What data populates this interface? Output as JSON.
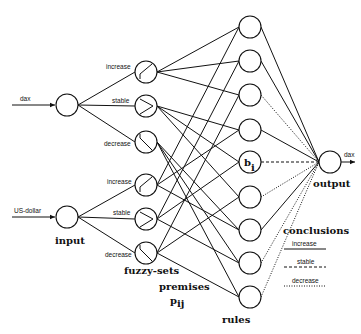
{
  "diagram": {
    "type": "fuzzy neural network",
    "inputs": [
      {
        "id": "dax",
        "label": "dax"
      },
      {
        "id": "usd",
        "label": "US-dollar"
      }
    ],
    "fuzzy_sets": [
      {
        "input": "dax",
        "label": "increase",
        "shape": "rising"
      },
      {
        "input": "dax",
        "label": "stable",
        "shape": "triangle"
      },
      {
        "input": "dax",
        "label": "decrease",
        "shape": "falling"
      },
      {
        "input": "usd",
        "label": "increase",
        "shape": "rising"
      },
      {
        "input": "usd",
        "label": "stable",
        "shape": "triangle"
      },
      {
        "input": "usd",
        "label": "decrease",
        "shape": "falling"
      }
    ],
    "rules_count": 9,
    "highlighted_rule_label": "b",
    "highlighted_rule_subscript": "i",
    "output_arrow_label": "dax",
    "layer_labels": {
      "input": "input",
      "fuzzy_sets": "fuzzy-sets",
      "premises": "premises",
      "premises_symbol": "p",
      "premises_subscript": "ij",
      "rules": "rules",
      "output": "output"
    },
    "legend": {
      "title": "conclusions",
      "items": [
        {
          "label": "increase",
          "style": "solid"
        },
        {
          "label": "stable",
          "style": "dashed"
        },
        {
          "label": "decrease",
          "style": "dotted"
        }
      ]
    },
    "conclusion_styles": [
      "solid",
      "solid",
      "dotted",
      "solid",
      "dashed",
      "dotted",
      "solid",
      "dotted",
      "dotted"
    ]
  }
}
